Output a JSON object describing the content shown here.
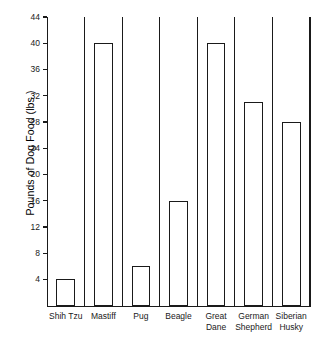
{
  "chart_data": {
    "type": "bar",
    "title": "",
    "xlabel": "",
    "ylabel": "Pounds of Dog Food (lbs.)",
    "categories": [
      "Shih Tzu",
      "Mastiff",
      "Pug",
      "Beagle",
      "Great Dane",
      "German Shepherd",
      "Siberian Husky"
    ],
    "category_lines": [
      [
        "Shih Tzu"
      ],
      [
        "Mastiff"
      ],
      [
        "Pug"
      ],
      [
        "Beagle"
      ],
      [
        "Great",
        "Dane"
      ],
      [
        "German",
        "Shepherd"
      ],
      [
        "Siberian",
        "Husky"
      ]
    ],
    "values": [
      4,
      40,
      6,
      16,
      40,
      31,
      28
    ],
    "ylim": [
      0,
      44
    ],
    "yticks": [
      4,
      8,
      12,
      16,
      20,
      24,
      28,
      32,
      36,
      40,
      44
    ],
    "ytick_labels": [
      "4",
      "8",
      "12",
      "16",
      "20",
      "24",
      "28",
      "32",
      "36",
      "40",
      "44"
    ],
    "grid": false,
    "legend": false,
    "bar_color": "#ffffff",
    "bar_edge_color": "#1a1a1a",
    "axis_color": "#1a1a1a",
    "background_color": "#ffffff"
  }
}
